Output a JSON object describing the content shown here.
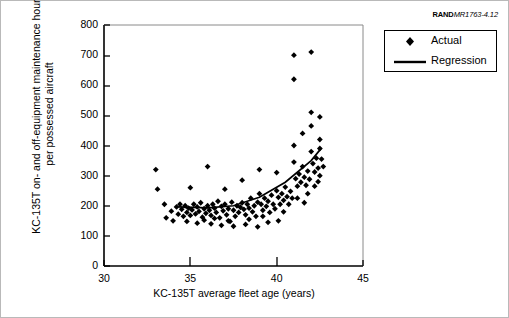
{
  "source_tag": {
    "brand": "RAND",
    "code": "MR1763-4.12"
  },
  "legend": {
    "position": "top-right",
    "entries": [
      {
        "label": "Actual",
        "symbol": "diamond-marker",
        "color": "#000000"
      },
      {
        "label": "Regression",
        "symbol": "solid-line",
        "color": "#000000"
      }
    ]
  },
  "chart_data": {
    "type": "scatter",
    "title": "",
    "subtitle": "",
    "xlabel": "KC-135T average fleet age (years)",
    "ylabel": "KC-135T on- and off-equipment maintenance hours per possessed aircraft",
    "xlim": [
      30,
      45
    ],
    "ylim": [
      0,
      800
    ],
    "xticks": [
      30,
      35,
      40,
      45
    ],
    "yticks": [
      0,
      100,
      200,
      300,
      400,
      500,
      600,
      700,
      800
    ],
    "grid": false,
    "marker_color": "#000000",
    "line_color": "#000000",
    "series": [
      {
        "name": "Actual",
        "type": "scatter",
        "points": [
          [
            33.0,
            320
          ],
          [
            33.1,
            255
          ],
          [
            33.5,
            205
          ],
          [
            33.6,
            160
          ],
          [
            33.9,
            182
          ],
          [
            34.0,
            150
          ],
          [
            34.2,
            196
          ],
          [
            34.3,
            172
          ],
          [
            34.4,
            205
          ],
          [
            34.5,
            188
          ],
          [
            34.6,
            165
          ],
          [
            34.7,
            200
          ],
          [
            34.8,
            178
          ],
          [
            34.9,
            192
          ],
          [
            35.0,
            260
          ],
          [
            35.0,
            168
          ],
          [
            35.1,
            186
          ],
          [
            35.2,
            205
          ],
          [
            35.3,
            173
          ],
          [
            35.4,
            196
          ],
          [
            35.5,
            181
          ],
          [
            35.6,
            210
          ],
          [
            35.7,
            162
          ],
          [
            35.8,
            190
          ],
          [
            35.9,
            175
          ],
          [
            36.0,
            330
          ],
          [
            36.0,
            200
          ],
          [
            36.1,
            185
          ],
          [
            36.2,
            168
          ],
          [
            36.3,
            205
          ],
          [
            36.4,
            192
          ],
          [
            36.5,
            178
          ],
          [
            36.6,
            215
          ],
          [
            36.7,
            160
          ],
          [
            36.8,
            198
          ],
          [
            36.9,
            183
          ],
          [
            37.0,
            255
          ],
          [
            37.0,
            205
          ],
          [
            37.1,
            170
          ],
          [
            37.2,
            190
          ],
          [
            37.3,
            148
          ],
          [
            37.4,
            212
          ],
          [
            37.5,
            185
          ],
          [
            37.6,
            165
          ],
          [
            37.7,
            200
          ],
          [
            37.8,
            178
          ],
          [
            37.9,
            195
          ],
          [
            38.0,
            285
          ],
          [
            38.0,
            210
          ],
          [
            38.1,
            188
          ],
          [
            38.2,
            170
          ],
          [
            38.3,
            205
          ],
          [
            38.4,
            192
          ],
          [
            38.5,
            225
          ],
          [
            38.6,
            180
          ],
          [
            38.7,
            200
          ],
          [
            38.8,
            165
          ],
          [
            38.9,
            212
          ],
          [
            39.0,
            320
          ],
          [
            39.0,
            240
          ],
          [
            39.1,
            205
          ],
          [
            39.2,
            185
          ],
          [
            39.3,
            225
          ],
          [
            39.4,
            198
          ],
          [
            39.5,
            215
          ],
          [
            39.6,
            178
          ],
          [
            39.7,
            235
          ],
          [
            39.8,
            205
          ],
          [
            39.9,
            190
          ],
          [
            40.0,
            310
          ],
          [
            40.0,
            250
          ],
          [
            40.1,
            228
          ],
          [
            40.2,
            205
          ],
          [
            40.3,
            240
          ],
          [
            40.4,
            218
          ],
          [
            40.5,
            262
          ],
          [
            40.6,
            230
          ],
          [
            40.7,
            205
          ],
          [
            40.8,
            248
          ],
          [
            40.9,
            225
          ],
          [
            41.0,
            700
          ],
          [
            41.0,
            620
          ],
          [
            41.0,
            400
          ],
          [
            41.0,
            345
          ],
          [
            41.1,
            290
          ],
          [
            41.2,
            265
          ],
          [
            41.3,
            305
          ],
          [
            41.4,
            278
          ],
          [
            41.5,
            440
          ],
          [
            41.5,
            330
          ],
          [
            41.6,
            295
          ],
          [
            41.7,
            268
          ],
          [
            41.8,
            315
          ],
          [
            41.9,
            288
          ],
          [
            42.0,
            710
          ],
          [
            42.0,
            510
          ],
          [
            42.0,
            465
          ],
          [
            42.0,
            380
          ],
          [
            42.1,
            340
          ],
          [
            42.2,
            312
          ],
          [
            42.3,
            358
          ],
          [
            42.4,
            325
          ],
          [
            42.5,
            495
          ],
          [
            42.5,
            420
          ],
          [
            42.5,
            390
          ],
          [
            42.5,
            300
          ],
          [
            42.6,
            355
          ],
          [
            42.7,
            330
          ],
          [
            36.2,
            140
          ],
          [
            36.8,
            135
          ],
          [
            37.5,
            132
          ],
          [
            38.2,
            138
          ],
          [
            38.9,
            130
          ],
          [
            39.5,
            145
          ],
          [
            40.1,
            150
          ],
          [
            35.4,
            142
          ],
          [
            34.8,
            148
          ],
          [
            41.2,
            225
          ],
          [
            41.8,
            240
          ],
          [
            42.2,
            265
          ],
          [
            40.4,
            180
          ],
          [
            39.2,
            165
          ],
          [
            38.4,
            155
          ],
          [
            37.2,
            150
          ],
          [
            36.4,
            158
          ],
          [
            35.8,
            152
          ],
          [
            42.4,
            280
          ],
          [
            41.6,
            210
          ]
        ]
      },
      {
        "name": "Regression",
        "type": "line",
        "points": [
          [
            34.3,
            196
          ],
          [
            36.0,
            193
          ],
          [
            37.5,
            200
          ],
          [
            39.0,
            228
          ],
          [
            40.5,
            278
          ],
          [
            42.0,
            350
          ],
          [
            42.6,
            392
          ]
        ]
      }
    ]
  }
}
